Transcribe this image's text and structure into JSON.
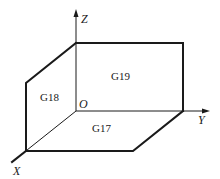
{
  "diagram": {
    "axes": {
      "x": {
        "label": "X"
      },
      "y": {
        "label": "Y"
      },
      "z": {
        "label": "Z"
      },
      "origin": {
        "label": "O"
      }
    },
    "planes": [
      {
        "id": "G17",
        "label": "G17",
        "plane": "XY"
      },
      {
        "id": "G18",
        "label": "G18",
        "plane": "ZX"
      },
      {
        "id": "G19",
        "label": "G19",
        "plane": "YZ"
      }
    ],
    "colors": {
      "line": "#1a1a1a",
      "background": "#ffffff"
    }
  }
}
